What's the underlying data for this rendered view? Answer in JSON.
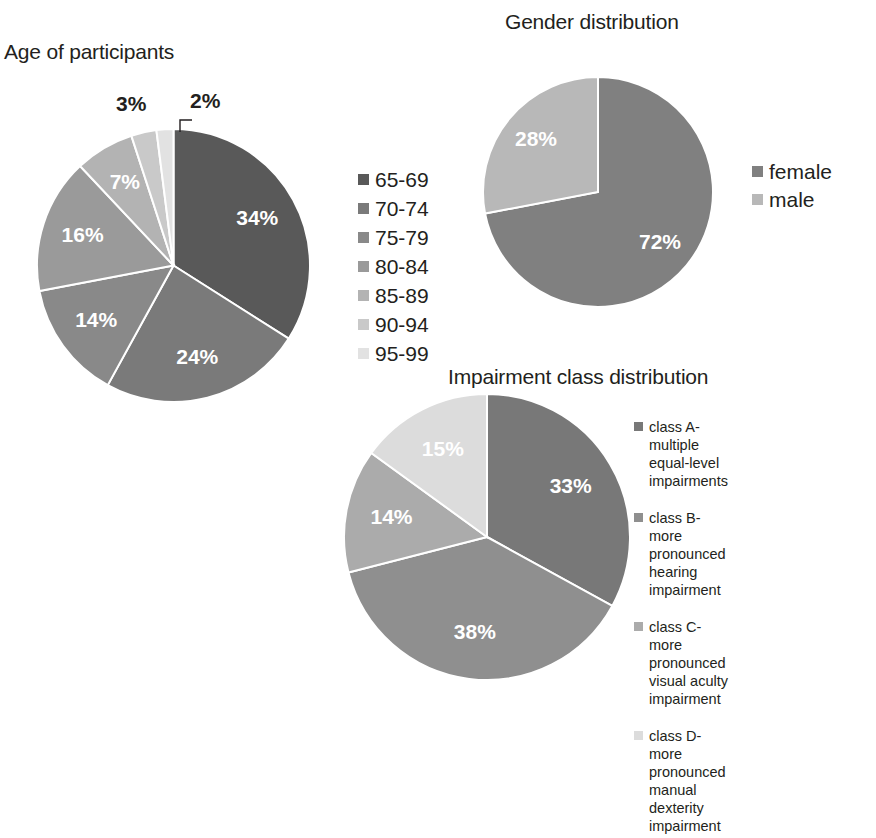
{
  "chart_data": [
    {
      "type": "pie",
      "id": "age",
      "title": "Age of participants",
      "categories": [
        "65-69",
        "70-74",
        "75-79",
        "80-84",
        "85-89",
        "90-94",
        "95-99"
      ],
      "values": [
        34,
        24,
        14,
        16,
        7,
        3,
        2
      ],
      "value_labels": [
        "34%",
        "24%",
        "14%",
        "16%",
        "7%",
        "3%",
        "2%"
      ],
      "colors": [
        "#595959",
        "#7a7a7a",
        "#898989",
        "#9a9a9a",
        "#b3b3b3",
        "#c9c9c9",
        "#e2e2e2"
      ],
      "legend_position": "right",
      "unit": "%"
    },
    {
      "type": "pie",
      "id": "gender",
      "title": "Gender distribution",
      "categories": [
        "female",
        "male"
      ],
      "values": [
        72,
        28
      ],
      "value_labels": [
        "72%",
        "28%"
      ],
      "colors": [
        "#808080",
        "#b8b8b8"
      ],
      "legend_position": "right",
      "unit": "%"
    },
    {
      "type": "pie",
      "id": "impairment",
      "title": "Impairment class distribution",
      "categories": [
        "class A-multiple equal-level impairments",
        "class B-more pronounced hearing impairment",
        "class C-more pronounced visual aculty impairment",
        "class D-more pronounced manual dexterity impairment"
      ],
      "values": [
        33,
        38,
        14,
        15
      ],
      "value_labels": [
        "33%",
        "38%",
        "14%",
        "15%"
      ],
      "colors": [
        "#787878",
        "#8f8f8f",
        "#ababab",
        "#dcdcdc"
      ],
      "legend_position": "right",
      "unit": "%"
    }
  ],
  "age_chart": {
    "title": "Age of participants",
    "legend": [
      {
        "label": "65-69",
        "color": "#595959"
      },
      {
        "label": "70-74",
        "color": "#7a7a7a"
      },
      {
        "label": "75-79",
        "color": "#898989"
      },
      {
        "label": "80-84",
        "color": "#9a9a9a"
      },
      {
        "label": "85-89",
        "color": "#b3b3b3"
      },
      {
        "label": "90-94",
        "color": "#c9c9c9"
      },
      {
        "label": "95-99",
        "color": "#e2e2e2"
      }
    ],
    "inside_labels": [
      "34%",
      "24%",
      "14%",
      "16%",
      "7%"
    ],
    "outside_labels": {
      "three": "3%",
      "two": "2%"
    }
  },
  "gender_chart": {
    "title": "Gender distribution",
    "legend": [
      {
        "label": "female",
        "color": "#808080"
      },
      {
        "label": "male",
        "color": "#b8b8b8"
      }
    ],
    "inside_labels": [
      "72%",
      "28%"
    ]
  },
  "impairment_chart": {
    "title": "Impairment class distribution",
    "legend": [
      {
        "label": "class A-multiple equal-level\nimpairments",
        "color": "#787878"
      },
      {
        "label": "class B-more pronounced\nhearing impairment",
        "color": "#8f8f8f"
      },
      {
        "label": "class C-more pronounced\nvisual aculty impairment",
        "color": "#ababab"
      },
      {
        "label": "class D-more pronounced\nmanual dexterity\nimpairment",
        "color": "#dcdcdc"
      }
    ],
    "inside_labels": [
      "33%",
      "38%",
      "14%",
      "15%"
    ]
  }
}
